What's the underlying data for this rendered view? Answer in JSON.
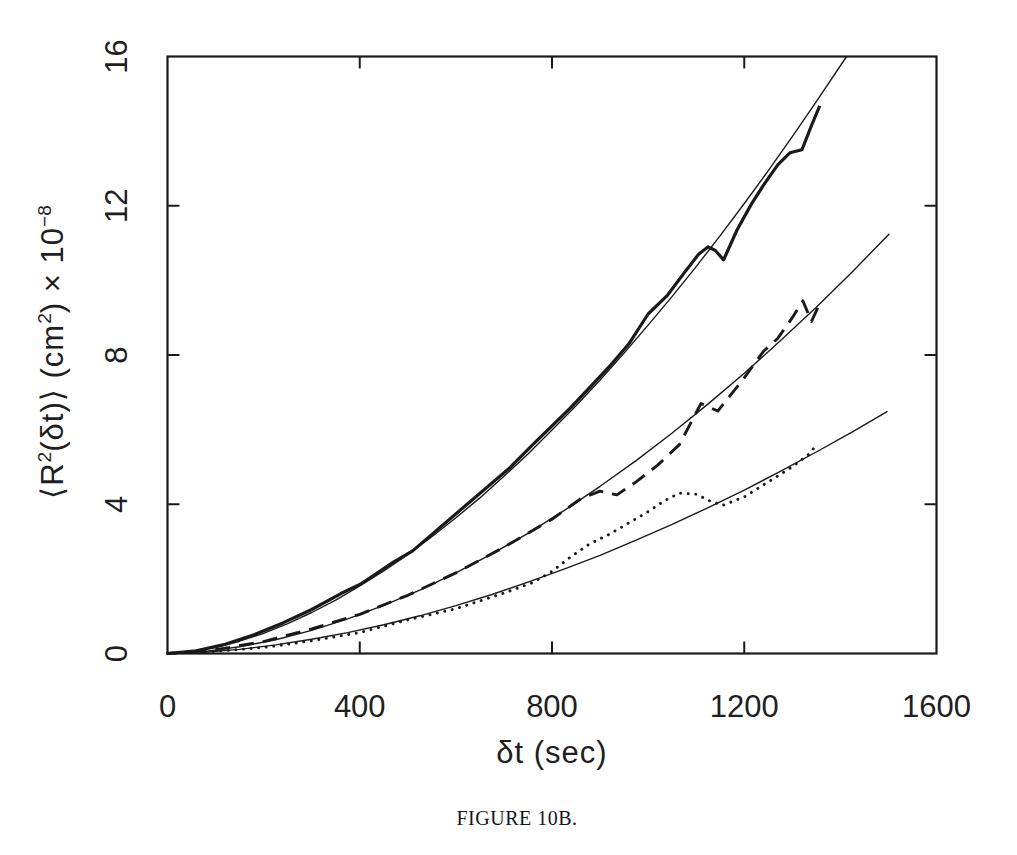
{
  "figure": {
    "background_color": "#ffffff",
    "ink_color": "#1a1a1a"
  },
  "chart_data": {
    "type": "line",
    "title": "",
    "xlabel": "δt (sec)",
    "ylabel": "⟨R²(δt)⟩ (cm²) × 10⁻⁸",
    "ylabel_parts": {
      "p1": "⟨R",
      "s1": "2",
      "p2": "(δt)⟩ (cm",
      "s2": "2",
      "p3": ") × 10",
      "s3": "−8"
    },
    "caption": "FIGURE 10B.",
    "xlim": [
      0,
      1600
    ],
    "ylim": [
      0,
      16
    ],
    "x_ticks": [
      0,
      400,
      800,
      1200,
      1600
    ],
    "y_ticks": [
      0,
      4,
      8,
      12,
      16
    ],
    "grid": false,
    "legend": "none",
    "frame": "box",
    "tick_direction": "in",
    "y_tick_label_rotation_deg": -90,
    "series": [
      {
        "name": "upper-data-curve",
        "line": "solid-thick",
        "points": [
          [
            0,
            0
          ],
          [
            60,
            0.07
          ],
          [
            120,
            0.25
          ],
          [
            180,
            0.5
          ],
          [
            240,
            0.82
          ],
          [
            300,
            1.18
          ],
          [
            360,
            1.6
          ],
          [
            400,
            1.85
          ],
          [
            430,
            2.1
          ],
          [
            470,
            2.45
          ],
          [
            510,
            2.75
          ],
          [
            560,
            3.3
          ],
          [
            610,
            3.85
          ],
          [
            660,
            4.4
          ],
          [
            710,
            4.95
          ],
          [
            760,
            5.6
          ],
          [
            800,
            6.1
          ],
          [
            840,
            6.6
          ],
          [
            880,
            7.15
          ],
          [
            920,
            7.7
          ],
          [
            960,
            8.3
          ],
          [
            1000,
            9.1
          ],
          [
            1040,
            9.6
          ],
          [
            1075,
            10.2
          ],
          [
            1105,
            10.7
          ],
          [
            1125,
            10.9
          ],
          [
            1140,
            10.8
          ],
          [
            1157,
            10.55
          ],
          [
            1185,
            11.35
          ],
          [
            1215,
            12.05
          ],
          [
            1240,
            12.55
          ],
          [
            1270,
            13.1
          ],
          [
            1295,
            13.42
          ],
          [
            1320,
            13.5
          ],
          [
            1340,
            14.15
          ],
          [
            1357,
            14.68
          ]
        ]
      },
      {
        "name": "upper-fit-line",
        "line": "thin",
        "points": [
          [
            0,
            0
          ],
          [
            50,
            0.05
          ],
          [
            100,
            0.16
          ],
          [
            150,
            0.33
          ],
          [
            200,
            0.54
          ],
          [
            250,
            0.8
          ],
          [
            300,
            1.1
          ],
          [
            350,
            1.43
          ],
          [
            400,
            1.81
          ],
          [
            450,
            2.21
          ],
          [
            500,
            2.65
          ],
          [
            550,
            3.13
          ],
          [
            600,
            3.64
          ],
          [
            650,
            4.17
          ],
          [
            700,
            4.75
          ],
          [
            750,
            5.35
          ],
          [
            800,
            5.99
          ],
          [
            850,
            6.64
          ],
          [
            900,
            7.33
          ],
          [
            950,
            8.05
          ],
          [
            1000,
            8.8
          ],
          [
            1050,
            9.57
          ],
          [
            1100,
            10.37
          ],
          [
            1150,
            11.2
          ],
          [
            1200,
            12.06
          ],
          [
            1250,
            12.94
          ],
          [
            1300,
            13.85
          ],
          [
            1350,
            14.79
          ],
          [
            1413,
            16.0
          ]
        ]
      },
      {
        "name": "middle-data-curve",
        "line": "dashed",
        "points": [
          [
            0,
            0
          ],
          [
            100,
            0.1
          ],
          [
            200,
            0.32
          ],
          [
            300,
            0.66
          ],
          [
            400,
            1.05
          ],
          [
            500,
            1.56
          ],
          [
            600,
            2.16
          ],
          [
            700,
            2.85
          ],
          [
            800,
            3.6
          ],
          [
            860,
            4.15
          ],
          [
            900,
            4.35
          ],
          [
            935,
            4.25
          ],
          [
            975,
            4.6
          ],
          [
            1020,
            5.05
          ],
          [
            1065,
            5.6
          ],
          [
            1110,
            6.7
          ],
          [
            1145,
            6.5
          ],
          [
            1195,
            7.3
          ],
          [
            1240,
            8.1
          ],
          [
            1270,
            8.45
          ],
          [
            1300,
            9.0
          ],
          [
            1322,
            9.45
          ],
          [
            1340,
            8.9
          ],
          [
            1356,
            9.35
          ]
        ]
      },
      {
        "name": "middle-fit-line",
        "line": "thin",
        "points": [
          [
            0,
            0
          ],
          [
            75,
            0.05
          ],
          [
            150,
            0.18
          ],
          [
            225,
            0.37
          ],
          [
            300,
            0.62
          ],
          [
            375,
            0.93
          ],
          [
            450,
            1.29
          ],
          [
            525,
            1.7
          ],
          [
            600,
            2.16
          ],
          [
            675,
            2.67
          ],
          [
            750,
            3.22
          ],
          [
            825,
            3.83
          ],
          [
            900,
            4.48
          ],
          [
            975,
            5.17
          ],
          [
            1050,
            5.91
          ],
          [
            1125,
            6.69
          ],
          [
            1200,
            7.51
          ],
          [
            1275,
            8.38
          ],
          [
            1350,
            9.28
          ],
          [
            1425,
            10.23
          ],
          [
            1502,
            11.25
          ]
        ]
      },
      {
        "name": "lower-data-curve",
        "line": "dotted",
        "points": [
          [
            0,
            0
          ],
          [
            100,
            0.06
          ],
          [
            200,
            0.16
          ],
          [
            300,
            0.34
          ],
          [
            400,
            0.56
          ],
          [
            500,
            0.9
          ],
          [
            600,
            1.2
          ],
          [
            700,
            1.62
          ],
          [
            760,
            1.9
          ],
          [
            800,
            2.2
          ],
          [
            840,
            2.6
          ],
          [
            880,
            2.95
          ],
          [
            920,
            3.2
          ],
          [
            960,
            3.5
          ],
          [
            1000,
            3.8
          ],
          [
            1035,
            4.1
          ],
          [
            1065,
            4.3
          ],
          [
            1100,
            4.27
          ],
          [
            1130,
            4.08
          ],
          [
            1155,
            3.97
          ],
          [
            1200,
            4.2
          ],
          [
            1250,
            4.6
          ],
          [
            1300,
            5.0
          ],
          [
            1335,
            5.35
          ],
          [
            1352,
            5.62
          ]
        ]
      },
      {
        "name": "lower-fit-line",
        "line": "thin",
        "points": [
          [
            0,
            0
          ],
          [
            75,
            0.03
          ],
          [
            150,
            0.11
          ],
          [
            225,
            0.23
          ],
          [
            300,
            0.38
          ],
          [
            375,
            0.56
          ],
          [
            450,
            0.77
          ],
          [
            525,
            1.01
          ],
          [
            600,
            1.28
          ],
          [
            675,
            1.58
          ],
          [
            750,
            1.91
          ],
          [
            825,
            2.26
          ],
          [
            900,
            2.63
          ],
          [
            975,
            3.04
          ],
          [
            1050,
            3.46
          ],
          [
            1125,
            3.91
          ],
          [
            1200,
            4.38
          ],
          [
            1275,
            4.88
          ],
          [
            1350,
            5.4
          ],
          [
            1425,
            5.94
          ],
          [
            1498,
            6.49
          ]
        ]
      }
    ]
  }
}
